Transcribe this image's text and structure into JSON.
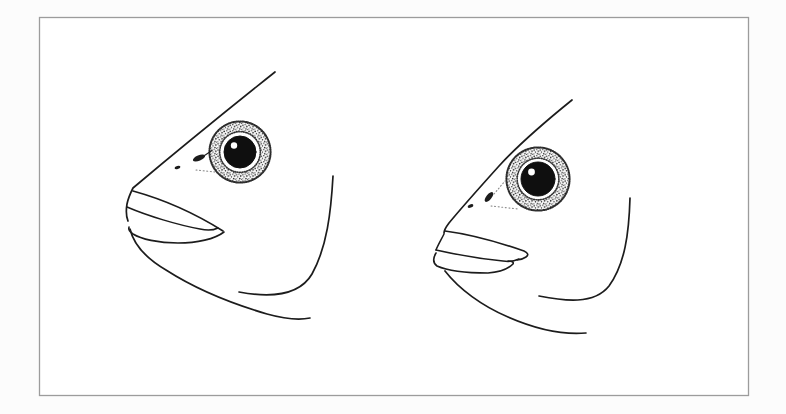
{
  "figure": {
    "kind": "fish-head-line-illustration-pair",
    "panels": [
      {
        "name": "fish-head-left"
      },
      {
        "name": "fish-head-right"
      }
    ]
  },
  "colors": {
    "page_background": "#fcfcfc",
    "paper": "#ffffff",
    "frame": "#9c9c9c",
    "ink": "#1c1c1c",
    "pupil": "#0f0f0f",
    "eye_highlight": "#ffffff",
    "stipple_dot": "#222222",
    "faint_dots": "#8a8a8a"
  }
}
